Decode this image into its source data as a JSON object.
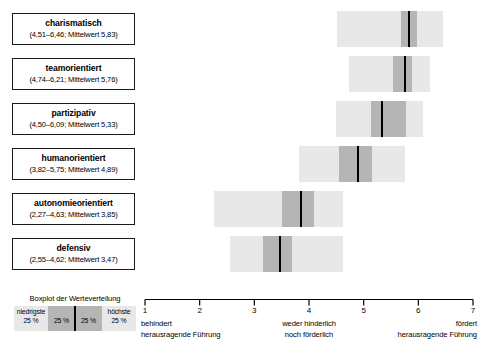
{
  "chart_data": {
    "type": "boxplot",
    "title": "",
    "xlabel": "",
    "ylabel": "",
    "xlim": [
      1,
      7
    ],
    "grid": false,
    "legend_position": "bottom-left",
    "categories": [
      "charismatisch",
      "teamorientiert",
      "partizipativ",
      "humanorientiert",
      "autonomieorientiert",
      "defensiv"
    ],
    "series": [
      {
        "name": "min",
        "values": [
          4.51,
          4.74,
          4.5,
          3.82,
          2.27,
          2.55
        ]
      },
      {
        "name": "q1",
        "values": [
          5.68,
          5.53,
          5.13,
          4.55,
          3.5,
          3.16
        ]
      },
      {
        "name": "mean",
        "values": [
          5.83,
          5.76,
          5.33,
          4.89,
          3.85,
          3.47
        ]
      },
      {
        "name": "q3",
        "values": [
          5.98,
          5.88,
          5.78,
          5.15,
          4.1,
          3.68
        ]
      },
      {
        "name": "max",
        "values": [
          6.46,
          6.21,
          6.09,
          5.75,
          4.63,
          4.62
        ]
      }
    ],
    "xticks": [
      1,
      2,
      3,
      4,
      5,
      6,
      7
    ],
    "xticklabels": [
      "1",
      "2",
      "3",
      "4",
      "5",
      "6",
      "7"
    ]
  },
  "rows": [
    {
      "name": "charismatisch",
      "label": "charismatisch",
      "range_text": "(4,51–6,46; Mittelwert 5,83)",
      "min": 4.51,
      "q1": 5.68,
      "mean": 5.83,
      "q3": 5.98,
      "max": 6.46
    },
    {
      "name": "teamorientiert",
      "label": "teamorientiert",
      "range_text": "(4,74–6,21; Mittelwert 5,76)",
      "min": 4.74,
      "q1": 5.53,
      "mean": 5.76,
      "q3": 5.88,
      "max": 6.21
    },
    {
      "name": "partizipativ",
      "label": "partizipativ",
      "range_text": "(4,50–6,09; Mittelwert 5,33)",
      "min": 4.5,
      "q1": 5.13,
      "mean": 5.33,
      "q3": 5.78,
      "max": 6.09
    },
    {
      "name": "humanorientiert",
      "label": "humanorientiert",
      "range_text": "(3,82–5,75; Mittelwert 4,89)",
      "min": 3.82,
      "q1": 4.55,
      "mean": 4.89,
      "q3": 5.15,
      "max": 5.75
    },
    {
      "name": "autonomieorientiert",
      "label": "autonomieorientiert",
      "range_text": "(2,27–4,63; Mittelwert 3,85)",
      "min": 2.27,
      "q1": 3.5,
      "mean": 3.85,
      "q3": 4.1,
      "max": 4.63
    },
    {
      "name": "defensiv",
      "label": "defensiv",
      "range_text": "(2,55–4,62; Mittelwert 3,47)",
      "min": 2.55,
      "q1": 3.16,
      "mean": 3.47,
      "q3": 3.68,
      "max": 4.62
    }
  ],
  "legend": {
    "title": "Boxplot der Werteverteilung",
    "seg_lowest_label": "niedrigste",
    "seg_lowest_pct": "25 %",
    "seg_q2_pct": "25 %",
    "seg_q3_pct": "25 %",
    "seg_highest_label": "höchste",
    "seg_highest_pct": "25 %"
  },
  "axis": {
    "ticks": [
      "1",
      "2",
      "3",
      "4",
      "5",
      "6",
      "7"
    ],
    "anchor_left_line1": "behindert",
    "anchor_left_line2": "herausragende Führung",
    "anchor_mid_line1": "weder hinderlich",
    "anchor_mid_line2": "noch förderlich",
    "anchor_right_line1": "fördert",
    "anchor_right_line2": "herausragende Führung"
  },
  "colors": {
    "whisker": "#e8e8e8",
    "iqr": "#b5b5b5",
    "median": "#000000",
    "border": "#1a1a1a"
  }
}
